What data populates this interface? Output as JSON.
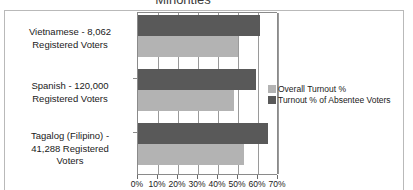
{
  "chart_data": {
    "type": "bar",
    "orientation": "horizontal",
    "title": "Minorities",
    "xlabel": "",
    "ylabel": "",
    "xlim": [
      0,
      70
    ],
    "grid": true,
    "legend_position": "right",
    "xticks": [
      "0%",
      "10%",
      "20%",
      "30%",
      "40%",
      "50%",
      "60%",
      "70%"
    ],
    "xtick_values": [
      0,
      10,
      20,
      30,
      40,
      50,
      60,
      70
    ],
    "categories": [
      "Vietnamese - 8,062 Registered Voters",
      "Spanish - 120,000 Registered Voters",
      "Tagalog (Filipino) - 41,288 Registered Voters"
    ],
    "category_lines": [
      [
        "Vietnamese - 8,062",
        "Registered Voters"
      ],
      [
        "Spanish - 120,000",
        "Registered Voters"
      ],
      [
        "Tagalog (Filipino) -",
        "41,288 Registered",
        "Voters"
      ]
    ],
    "series": [
      {
        "name": "Overall Turnout %",
        "color": "#b3b3b3",
        "values": [
          50,
          48,
          53
        ]
      },
      {
        "name": "Turnout % of Absentee Voters",
        "color": "#595959",
        "values": [
          61,
          59,
          65
        ]
      }
    ]
  },
  "legend": {
    "items": [
      {
        "label": "Overall Turnout %"
      },
      {
        "label": "Turnout % of Absentee Voters"
      }
    ]
  }
}
